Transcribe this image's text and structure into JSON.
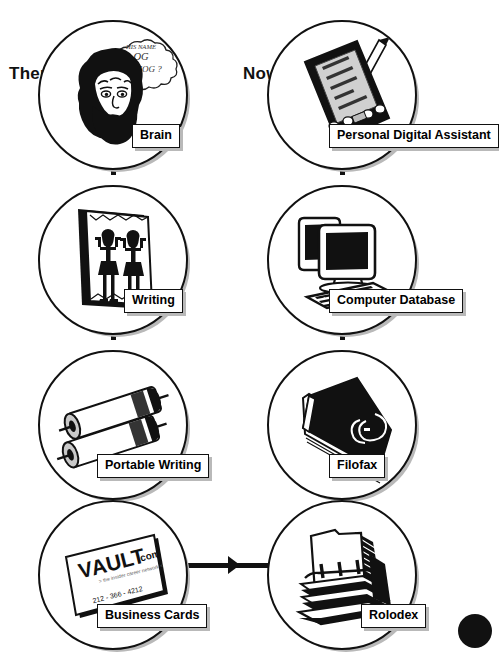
{
  "diagram": {
    "columns": [
      {
        "id": "then",
        "label": "Then"
      },
      {
        "id": "now",
        "label": "Now"
      }
    ],
    "rows": [
      {
        "then": {
          "caption": "Brain",
          "icon": "caveman-head-icon",
          "thought_bubble": {
            "line1": "HIS NAME",
            "line2": "OG",
            "line3": "OR MOG ?"
          }
        },
        "now": {
          "caption": "Personal Digital Assistant",
          "icon": "pda-with-stylus-icon",
          "screen_lines": [
            "",
            "",
            "",
            "",
            ""
          ]
        }
      },
      {
        "then": {
          "caption": "Writing",
          "icon": "hieroglyph-tablet-icon"
        },
        "now": {
          "caption": "Computer Database",
          "icon": "desktop-computer-icon"
        }
      },
      {
        "then": {
          "caption": "Portable Writing",
          "icon": "paper-scrolls-icon"
        },
        "now": {
          "caption": "Filofax",
          "icon": "organizer-binder-icon"
        }
      },
      {
        "then": {
          "caption": "Business Cards",
          "icon": "business-card-icon",
          "card": {
            "brand_a": "V",
            "brand_b": "AULT",
            "brand_suffix": ".com",
            "tagline": "the insider career network",
            "phone": "212 - 366 - 4212"
          }
        },
        "now": {
          "caption": "Rolodex",
          "icon": "rolodex-card-file-icon"
        }
      }
    ],
    "connectors": {
      "then_column": "arrow-down",
      "now_column": "arrow-up",
      "bottom_bridge": "arrow-right"
    },
    "colors": {
      "ink": "#111111",
      "paper": "#ffffff",
      "shadow": "#b9b9b9",
      "screen_gray": "#9a9a9a"
    }
  }
}
